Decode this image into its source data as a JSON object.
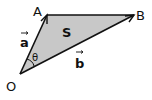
{
  "diagram": {
    "points": {
      "O": {
        "label": "O"
      },
      "A": {
        "label": "A"
      },
      "B": {
        "label": "B"
      }
    },
    "vectors": {
      "a": {
        "label": "a",
        "from": "O",
        "to": "A"
      },
      "b": {
        "label": "b",
        "from": "O",
        "to": "B"
      }
    },
    "angle_label": "θ",
    "area_label": "S",
    "colors": {
      "fill": "#c8c8c8",
      "stroke": "#111111"
    }
  }
}
